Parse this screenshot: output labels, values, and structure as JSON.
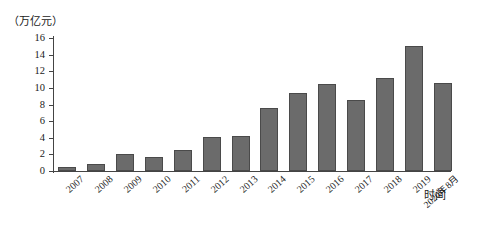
{
  "chart_data": {
    "type": "bar",
    "title": "",
    "subtitle": "",
    "unit_label": "（万亿元）",
    "ylabel": "",
    "xlabel": "时间",
    "ylim": [
      0,
      16
    ],
    "ytick_step": 2,
    "yticks": [
      "16",
      "14",
      "12",
      "10",
      "8",
      "6",
      "4",
      "2",
      "0"
    ],
    "grid": false,
    "legend": null,
    "bar_color": "#6b6b6b",
    "bar_border_color": "#4a4a4a",
    "axis_color": "#444444",
    "categories": [
      "2007",
      "2008",
      "2009",
      "2010",
      "2011",
      "2012",
      "2013",
      "2014",
      "2015",
      "2016",
      "2017",
      "2018",
      "2019",
      "2020年8月"
    ],
    "values": [
      0.5,
      0.9,
      2.0,
      1.7,
      2.5,
      4.1,
      4.2,
      7.6,
      9.4,
      10.5,
      8.5,
      11.2,
      15.0,
      10.6
    ]
  }
}
